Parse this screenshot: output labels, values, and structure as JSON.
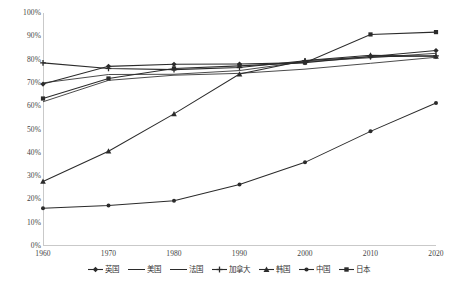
{
  "chart_data": {
    "type": "line",
    "title": "",
    "xlabel": "",
    "ylabel": "",
    "categories": [
      "1960",
      "1970",
      "1980",
      "1990",
      "2000",
      "2010",
      "2020"
    ],
    "x": [
      1960,
      1970,
      1980,
      1990,
      2000,
      2010,
      2020
    ],
    "ylim": [
      0,
      100
    ],
    "ytick_values": [
      0,
      10,
      20,
      30,
      40,
      50,
      60,
      70,
      80,
      90,
      100
    ],
    "ytick_labels": [
      "0%",
      "10%",
      "20%",
      "30%",
      "40%",
      "50%",
      "60%",
      "70%",
      "80%",
      "90%",
      "100%"
    ],
    "grid": false,
    "legend_position": "bottom",
    "value_suffix": "%",
    "series": [
      {
        "name": "英国",
        "marker": "diamond",
        "values": [
          69.5,
          77.1,
          78.0,
          78.1,
          78.7,
          81.3,
          83.9
        ]
      },
      {
        "name": "美国",
        "marker": "none",
        "values": [
          70.0,
          73.6,
          73.7,
          75.3,
          79.1,
          80.8,
          82.7
        ]
      },
      {
        "name": "法国",
        "marker": "none",
        "values": [
          61.9,
          71.1,
          73.3,
          74.1,
          75.9,
          78.4,
          81.0
        ]
      },
      {
        "name": "加拿大",
        "marker": "cross",
        "values": [
          78.6,
          76.2,
          75.7,
          76.6,
          79.5,
          81.2,
          81.6
        ]
      },
      {
        "name": "韩国",
        "marker": "triangle",
        "values": [
          27.7,
          40.7,
          56.7,
          73.8,
          79.6,
          81.9,
          81.4
        ]
      },
      {
        "name": "中国",
        "marker": "circle",
        "values": [
          16.2,
          17.4,
          19.4,
          26.4,
          35.9,
          49.2,
          61.4
        ]
      },
      {
        "name": "日本",
        "marker": "square",
        "values": [
          63.3,
          71.9,
          76.2,
          77.3,
          78.7,
          90.8,
          91.8
        ]
      }
    ],
    "series_color": "#2b2b2b",
    "axis_color": "#c9c9c9"
  },
  "caption": {
    "text": ""
  }
}
